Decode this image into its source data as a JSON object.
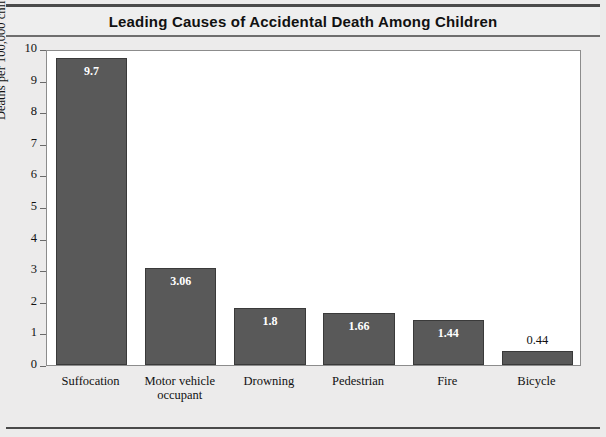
{
  "chart_data": {
    "type": "bar",
    "title": "Leading Causes of Accidental Death Among Children",
    "xlabel": "",
    "ylabel": "Deaths per 100,000 children",
    "categories": [
      "Suffocation",
      "Motor vehicle occupant",
      "Drowning",
      "Pedestrian",
      "Fire",
      "Bicycle"
    ],
    "category_lines": [
      [
        "Suffocation"
      ],
      [
        "Motor vehicle",
        "occupant"
      ],
      [
        "Drowning"
      ],
      [
        "Pedestrian"
      ],
      [
        "Fire"
      ],
      [
        "Bicycle"
      ]
    ],
    "values": [
      9.7,
      3.06,
      1.8,
      1.66,
      1.44,
      0.44
    ],
    "value_labels": [
      "9.7",
      "3.06",
      "1.8",
      "1.66",
      "1.44",
      "0.44"
    ],
    "label_placement": [
      "inside",
      "inside",
      "inside",
      "inside",
      "inside",
      "above"
    ],
    "ylim": [
      0,
      10
    ],
    "yticks": [
      0,
      1,
      2,
      3,
      4,
      5,
      6,
      7,
      8,
      9,
      10
    ],
    "ytick_labels": [
      "0",
      "1",
      "2",
      "3",
      "4",
      "5",
      "6",
      "7",
      "8",
      "9",
      "10"
    ],
    "grid": false,
    "legend": false,
    "bar_color": "#595959",
    "bar_edge_color": "#3a3a3a",
    "plot_background": "#ffffff",
    "page_background": "#ecebeb",
    "title_band_background": "#eeeeee",
    "text_color": "#111111",
    "inside_label_color": "#ffffff"
  }
}
